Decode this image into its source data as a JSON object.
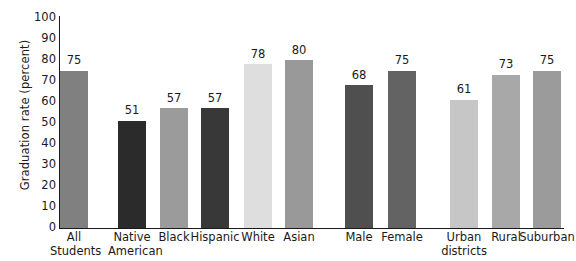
{
  "chart_data": {
    "type": "bar",
    "title": "",
    "xlabel": "",
    "ylabel": "Graduation rate (percent)",
    "ylim": [
      0,
      100
    ],
    "grid": false,
    "legend": "none",
    "y_ticks": [
      100,
      90,
      80,
      70,
      60,
      50,
      40,
      30,
      20,
      10,
      0
    ],
    "categories": [
      "All Students",
      "Native American",
      "Black",
      "Hispanic",
      "White",
      "Asian",
      "Male",
      "Female",
      "Urban districts",
      "Rural",
      "Suburban"
    ],
    "values": [
      75,
      51,
      57,
      57,
      78,
      80,
      68,
      75,
      61,
      73,
      75
    ],
    "bars": [
      {
        "label_line1": "All",
        "label_line2": "Students",
        "value": 75,
        "color": "#808080",
        "x": 60,
        "width": 28,
        "label_x": 50,
        "label_w": 48
      },
      {
        "label_line1": "Native",
        "label_line2": "American",
        "value": 51,
        "color": "#2b2b2b",
        "x": 118,
        "width": 28,
        "label_x": 108,
        "label_w": 48
      },
      {
        "label_line1": "Black",
        "label_line2": "",
        "value": 57,
        "color": "#9b9b9b",
        "x": 160,
        "width": 28,
        "label_x": 150,
        "label_w": 48
      },
      {
        "label_line1": "Hispanic",
        "label_line2": "",
        "value": 57,
        "color": "#383838",
        "x": 201,
        "width": 28,
        "label_x": 188,
        "label_w": 54
      },
      {
        "label_line1": "White",
        "label_line2": "",
        "value": 78,
        "color": "#dedede",
        "x": 244,
        "width": 28,
        "label_x": 234,
        "label_w": 48
      },
      {
        "label_line1": "Asian",
        "label_line2": "",
        "value": 80,
        "color": "#999999",
        "x": 285,
        "width": 28,
        "label_x": 275,
        "label_w": 48
      },
      {
        "label_line1": "Male",
        "label_line2": "",
        "value": 68,
        "color": "#4f4f4f",
        "x": 345,
        "width": 28,
        "label_x": 335,
        "label_w": 48
      },
      {
        "label_line1": "Female",
        "label_line2": "",
        "value": 75,
        "color": "#636363",
        "x": 388,
        "width": 28,
        "label_x": 376,
        "label_w": 52
      },
      {
        "label_line1": "Urban",
        "label_line2": "districts",
        "value": 61,
        "color": "#c6c6c6",
        "x": 450,
        "width": 28,
        "label_x": 438,
        "label_w": 52
      },
      {
        "label_line1": "Rural",
        "label_line2": "",
        "value": 73,
        "color": "#a8a8a8",
        "x": 492,
        "width": 28,
        "label_x": 481,
        "label_w": 50
      },
      {
        "label_line1": "Suburban",
        "label_line2": "",
        "value": 75,
        "color": "#9b9b9b",
        "x": 533,
        "width": 28,
        "label_x": 518,
        "label_w": 58
      }
    ]
  }
}
